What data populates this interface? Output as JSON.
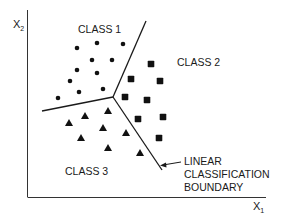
{
  "diagram": {
    "axes": {
      "x_label": "X",
      "x_sub": "1",
      "y_label": "X",
      "y_sub": "2"
    },
    "labels": {
      "class1": "CLASS 1",
      "class2": "CLASS 2",
      "class3": "CLASS 3",
      "boundary_line1": "LINEAR",
      "boundary_line2": "CLASSIFICATION",
      "boundary_line3": "BOUNDARY"
    },
    "colors": {
      "ink": "#1a1a1a",
      "background": "#ffffff"
    },
    "boundary": {
      "junction": [
        113,
        97
      ],
      "ends": [
        [
          146,
          21
        ],
        [
          42,
          111
        ],
        [
          162,
          170
        ]
      ]
    },
    "class1_points_circle": [
      [
        77,
        48
      ],
      [
        97,
        43
      ],
      [
        123,
        44
      ],
      [
        92,
        60
      ],
      [
        112,
        60
      ],
      [
        77,
        70
      ],
      [
        97,
        73
      ],
      [
        70,
        81
      ],
      [
        79,
        92
      ],
      [
        103,
        89
      ],
      [
        58,
        98
      ]
    ],
    "class2_points_square": [
      [
        151,
        64
      ],
      [
        131,
        79
      ],
      [
        160,
        81
      ],
      [
        125,
        97
      ],
      [
        147,
        100
      ],
      [
        138,
        119
      ],
      [
        163,
        117
      ],
      [
        159,
        138
      ]
    ],
    "class3_points_triangle": [
      [
        69,
        123
      ],
      [
        85,
        116
      ],
      [
        108,
        111
      ],
      [
        103,
        128
      ],
      [
        81,
        138
      ],
      [
        126,
        133
      ],
      [
        108,
        148
      ],
      [
        140,
        153
      ]
    ]
  }
}
